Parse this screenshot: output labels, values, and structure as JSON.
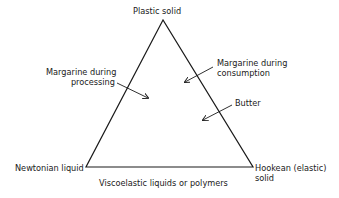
{
  "diagram": {
    "type": "ternary-triangle",
    "vertices": {
      "top": "Plastic solid",
      "bottom_left": "Newtonian liquid",
      "bottom_right_line1": "Hookean (elastic)",
      "bottom_right_line2": "solid"
    },
    "edge_labels": {
      "bottom": "Viscoelastic liquids or polymers"
    },
    "points": [
      {
        "line1": "Margarine during",
        "line2": "processing",
        "position": "inside-left"
      },
      {
        "line1": "Margarine during",
        "line2": "consumption",
        "position": "inside-right-upper"
      },
      {
        "line1": "Butter",
        "position": "inside-right-lower"
      }
    ],
    "colors": {
      "line": "#1a1a1a",
      "background": "#ffffff"
    }
  }
}
